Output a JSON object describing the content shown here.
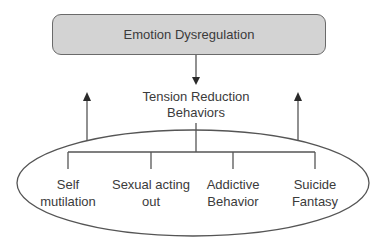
{
  "diagram": {
    "root": {
      "label": "Emotion Dysregulation",
      "fill": "#d3d3d3",
      "stroke": "#6a6a6a"
    },
    "middle": {
      "line1": "Tension Reduction",
      "line2": "Behaviors"
    },
    "leaves": [
      {
        "line1": "Self",
        "line2": "mutilation"
      },
      {
        "line1": "Sexual acting",
        "line2": "out"
      },
      {
        "line1": "Addictive",
        "line2": "Behavior"
      },
      {
        "line1": "Suicide",
        "line2": "Fantasy"
      }
    ],
    "arrows": [
      {
        "from": "Emotion Dysregulation",
        "to": "Tension Reduction Behaviors",
        "direction": "down"
      },
      {
        "from": "ellipse-left",
        "direction": "up"
      },
      {
        "from": "ellipse-right",
        "direction": "up"
      }
    ]
  }
}
